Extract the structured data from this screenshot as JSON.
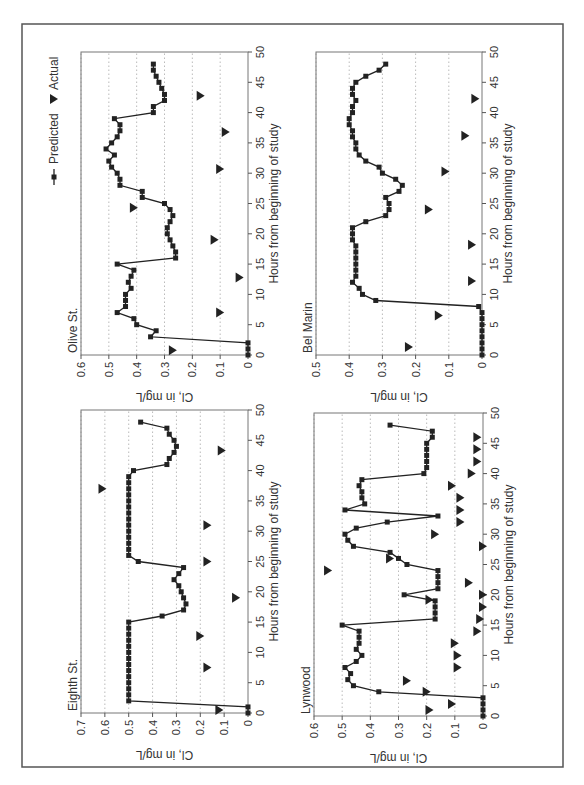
{
  "figure": {
    "orientation_deg": -90,
    "frame_color": "#555555",
    "line_color": "#222222",
    "grid_color": "#aaaaaa",
    "legend": {
      "predicted_label": "Predicted",
      "actual_label": "Actual"
    }
  },
  "chart_data": [
    {
      "type": "line",
      "title": "Eighth St.",
      "xlabel": "Hours from beginning of study",
      "ylabel": "Cl, in mg/L",
      "xlim": [
        0,
        50
      ],
      "ylim": [
        0,
        0.7
      ],
      "xticks": [
        0,
        5,
        10,
        15,
        20,
        25,
        30,
        35,
        40,
        45,
        50
      ],
      "yticks": [
        0,
        0.1,
        0.2,
        0.3,
        0.4,
        0.5,
        0.6,
        0.7
      ],
      "grid": "horizontal dotted",
      "series": [
        {
          "name": "Predicted",
          "marker": "square",
          "points": [
            [
              0,
              0
            ],
            [
              1,
              0
            ],
            [
              2,
              0.5
            ],
            [
              3,
              0.5
            ],
            [
              4,
              0.5
            ],
            [
              5,
              0.5
            ],
            [
              6,
              0.5
            ],
            [
              7,
              0.5
            ],
            [
              8,
              0.5
            ],
            [
              9,
              0.5
            ],
            [
              10,
              0.5
            ],
            [
              11,
              0.5
            ],
            [
              12,
              0.5
            ],
            [
              13,
              0.5
            ],
            [
              14,
              0.5
            ],
            [
              15,
              0.5
            ],
            [
              16,
              0.36
            ],
            [
              17,
              0.27
            ],
            [
              18,
              0.26
            ],
            [
              19,
              0.27
            ],
            [
              20,
              0.28
            ],
            [
              21,
              0.29
            ],
            [
              22,
              0.31
            ],
            [
              23,
              0.29
            ],
            [
              24,
              0.27
            ],
            [
              25,
              0.46
            ],
            [
              26,
              0.5
            ],
            [
              27,
              0.5
            ],
            [
              28,
              0.5
            ],
            [
              29,
              0.5
            ],
            [
              30,
              0.5
            ],
            [
              31,
              0.5
            ],
            [
              32,
              0.5
            ],
            [
              33,
              0.5
            ],
            [
              34,
              0.5
            ],
            [
              35,
              0.5
            ],
            [
              36,
              0.5
            ],
            [
              37,
              0.5
            ],
            [
              38,
              0.5
            ],
            [
              39,
              0.5
            ],
            [
              40,
              0.48
            ],
            [
              41,
              0.34
            ],
            [
              42,
              0.33
            ],
            [
              43,
              0.31
            ],
            [
              44,
              0.3
            ],
            [
              45,
              0.31
            ],
            [
              46,
              0.33
            ],
            [
              47,
              0.34
            ],
            [
              48,
              0.45
            ]
          ]
        },
        {
          "name": "Actual",
          "marker": "triangle-down",
          "points": [
            [
              0.5,
              0.12
            ],
            [
              7.5,
              0.17
            ],
            [
              12.7,
              0.2
            ],
            [
              19,
              0.05
            ],
            [
              25,
              0.17
            ],
            [
              31,
              0.17
            ],
            [
              37,
              0.61
            ],
            [
              43.3,
              0.11
            ]
          ]
        }
      ]
    },
    {
      "type": "line",
      "title": "Olive St.",
      "xlabel": "Hours from beginning of study",
      "ylabel": "Cl, in mg/L",
      "xlim": [
        0,
        50
      ],
      "ylim": [
        0,
        0.6
      ],
      "xticks": [
        0,
        5,
        10,
        15,
        20,
        25,
        30,
        35,
        40,
        45,
        50
      ],
      "yticks": [
        0,
        0.1,
        0.2,
        0.3,
        0.4,
        0.5,
        0.6
      ],
      "grid": "horizontal dotted",
      "legend_position": "top-right",
      "series": [
        {
          "name": "Predicted",
          "marker": "square",
          "points": [
            [
              0,
              0
            ],
            [
              1,
              0
            ],
            [
              2,
              0
            ],
            [
              3,
              0.35
            ],
            [
              4,
              0.33
            ],
            [
              5,
              0.4
            ],
            [
              6,
              0.41
            ],
            [
              7,
              0.47
            ],
            [
              8,
              0.44
            ],
            [
              9,
              0.44
            ],
            [
              10,
              0.44
            ],
            [
              11,
              0.42
            ],
            [
              12,
              0.43
            ],
            [
              13,
              0.42
            ],
            [
              14,
              0.41
            ],
            [
              15,
              0.47
            ],
            [
              16,
              0.26
            ],
            [
              17,
              0.26
            ],
            [
              18,
              0.27
            ],
            [
              19,
              0.28
            ],
            [
              20,
              0.29
            ],
            [
              21,
              0.29
            ],
            [
              22,
              0.28
            ],
            [
              23,
              0.27
            ],
            [
              24,
              0.28
            ],
            [
              25,
              0.3
            ],
            [
              26,
              0.38
            ],
            [
              27,
              0.38
            ],
            [
              28,
              0.46
            ],
            [
              29,
              0.46
            ],
            [
              30,
              0.47
            ],
            [
              31,
              0.49
            ],
            [
              32,
              0.5
            ],
            [
              33,
              0.48
            ],
            [
              34,
              0.51
            ],
            [
              35,
              0.49
            ],
            [
              36,
              0.47
            ],
            [
              37,
              0.46
            ],
            [
              38,
              0.46
            ],
            [
              39,
              0.48
            ],
            [
              40,
              0.34
            ],
            [
              41,
              0.34
            ],
            [
              42,
              0.3
            ],
            [
              43,
              0.3
            ],
            [
              44,
              0.31
            ],
            [
              45,
              0.32
            ],
            [
              46,
              0.33
            ],
            [
              47,
              0.34
            ],
            [
              48,
              0.34
            ]
          ]
        },
        {
          "name": "Actual",
          "marker": "triangle-down",
          "points": [
            [
              0.8,
              0.27
            ],
            [
              7,
              0.1
            ],
            [
              12.8,
              0.03
            ],
            [
              19,
              0.12
            ],
            [
              24.3,
              0.41
            ],
            [
              30.7,
              0.1
            ],
            [
              36.8,
              0.08
            ],
            [
              42.8,
              0.17
            ]
          ]
        }
      ]
    },
    {
      "type": "line",
      "title": "Lynwood",
      "xlabel": "Hours from beginning of study",
      "ylabel": "Cl, in mg/L",
      "xlim": [
        0,
        50
      ],
      "ylim": [
        0,
        0.6
      ],
      "xticks": [
        0,
        5,
        10,
        15,
        20,
        25,
        30,
        35,
        40,
        45,
        50
      ],
      "yticks": [
        0,
        0.1,
        0.2,
        0.3,
        0.4,
        0.5,
        0.6
      ],
      "grid": "horizontal dotted",
      "series": [
        {
          "name": "Predicted",
          "marker": "square",
          "points": [
            [
              0,
              0
            ],
            [
              1,
              0
            ],
            [
              2,
              0
            ],
            [
              3,
              0
            ],
            [
              4,
              0.37
            ],
            [
              5,
              0.46
            ],
            [
              6,
              0.48
            ],
            [
              7,
              0.47
            ],
            [
              8,
              0.49
            ],
            [
              9,
              0.45
            ],
            [
              10,
              0.43
            ],
            [
              11,
              0.45
            ],
            [
              12,
              0.44
            ],
            [
              13,
              0.44
            ],
            [
              14,
              0.44
            ],
            [
              15,
              0.5
            ],
            [
              16,
              0.17
            ],
            [
              17,
              0.17
            ],
            [
              18,
              0.17
            ],
            [
              19,
              0.17
            ],
            [
              20,
              0.28
            ],
            [
              21,
              0.16
            ],
            [
              22,
              0.16
            ],
            [
              23,
              0.16
            ],
            [
              24,
              0.16
            ],
            [
              25,
              0.27
            ],
            [
              26,
              0.3
            ],
            [
              27,
              0.33
            ],
            [
              28,
              0.46
            ],
            [
              29,
              0.48
            ],
            [
              30,
              0.49
            ],
            [
              31,
              0.45
            ],
            [
              32,
              0.34
            ],
            [
              33,
              0.16
            ],
            [
              34,
              0.49
            ],
            [
              35,
              0.42
            ],
            [
              36,
              0.43
            ],
            [
              37,
              0.43
            ],
            [
              38,
              0.44
            ],
            [
              39,
              0.43
            ],
            [
              40,
              0.21
            ],
            [
              41,
              0.2
            ],
            [
              42,
              0.2
            ],
            [
              43,
              0.2
            ],
            [
              44,
              0.2
            ],
            [
              45,
              0.2
            ],
            [
              46,
              0.18
            ],
            [
              47,
              0.18
            ],
            [
              48,
              0.33
            ]
          ]
        },
        {
          "name": "Actual",
          "marker": "triangle-down",
          "points": [
            [
              1,
              0.19
            ],
            [
              2,
              0.11
            ],
            [
              4,
              0.2
            ],
            [
              5.8,
              0.27
            ],
            [
              8,
              0.09
            ],
            [
              10,
              0.09
            ],
            [
              12,
              0.1
            ],
            [
              14,
              0.02
            ],
            [
              16,
              0.01
            ],
            [
              18,
              0.0
            ],
            [
              20,
              0.0
            ],
            [
              19.2,
              0.19
            ],
            [
              22,
              0.05
            ],
            [
              24,
              0.55
            ],
            [
              26,
              0.33
            ],
            [
              28,
              0.0
            ],
            [
              30,
              0.17
            ],
            [
              32,
              0.08
            ],
            [
              34,
              0.08
            ],
            [
              36,
              0.08
            ],
            [
              38,
              0.11
            ],
            [
              40,
              0.04
            ],
            [
              42,
              0.02
            ],
            [
              44,
              0.02
            ],
            [
              46,
              0.02
            ]
          ]
        }
      ]
    },
    {
      "type": "line",
      "title": "Bel Marin",
      "xlabel": "Hours from beginning of study",
      "ylabel": "Cl, in mg/L",
      "xlim": [
        0,
        50
      ],
      "ylim": [
        0,
        0.5
      ],
      "xticks": [
        0,
        5,
        10,
        15,
        20,
        25,
        30,
        35,
        40,
        45,
        50
      ],
      "yticks": [
        0,
        0.1,
        0.2,
        0.3,
        0.4,
        0.5
      ],
      "grid": "horizontal dotted",
      "series": [
        {
          "name": "Predicted",
          "marker": "square",
          "points": [
            [
              0,
              0
            ],
            [
              1,
              0
            ],
            [
              2,
              0
            ],
            [
              3,
              0
            ],
            [
              4,
              0
            ],
            [
              5,
              0
            ],
            [
              6,
              0
            ],
            [
              7,
              0
            ],
            [
              8,
              0.01
            ],
            [
              9,
              0.32
            ],
            [
              10,
              0.36
            ],
            [
              11,
              0.37
            ],
            [
              12,
              0.39
            ],
            [
              13,
              0.38
            ],
            [
              14,
              0.38
            ],
            [
              15,
              0.38
            ],
            [
              16,
              0.38
            ],
            [
              17,
              0.38
            ],
            [
              18,
              0.38
            ],
            [
              19,
              0.39
            ],
            [
              20,
              0.39
            ],
            [
              21,
              0.39
            ],
            [
              22,
              0.35
            ],
            [
              23,
              0.29
            ],
            [
              24,
              0.28
            ],
            [
              25,
              0.28
            ],
            [
              26,
              0.29
            ],
            [
              27,
              0.25
            ],
            [
              28,
              0.24
            ],
            [
              29,
              0.26
            ],
            [
              30,
              0.3
            ],
            [
              31,
              0.31
            ],
            [
              32,
              0.35
            ],
            [
              33,
              0.37
            ],
            [
              34,
              0.38
            ],
            [
              35,
              0.38
            ],
            [
              36,
              0.39
            ],
            [
              37,
              0.39
            ],
            [
              38,
              0.4
            ],
            [
              39,
              0.4
            ],
            [
              40,
              0.39
            ],
            [
              41,
              0.39
            ],
            [
              42,
              0.38
            ],
            [
              43,
              0.39
            ],
            [
              44,
              0.39
            ],
            [
              45,
              0.38
            ],
            [
              46,
              0.35
            ],
            [
              47,
              0.31
            ],
            [
              48,
              0.29
            ]
          ]
        },
        {
          "name": "Actual",
          "marker": "triangle-down",
          "points": [
            [
              1.3,
              0.22
            ],
            [
              6.5,
              0.13
            ],
            [
              12.2,
              0.03
            ],
            [
              18.2,
              0.03
            ],
            [
              24,
              0.16
            ],
            [
              30.3,
              0.11
            ],
            [
              36.2,
              0.05
            ],
            [
              42.3,
              0.02
            ]
          ]
        }
      ]
    }
  ]
}
